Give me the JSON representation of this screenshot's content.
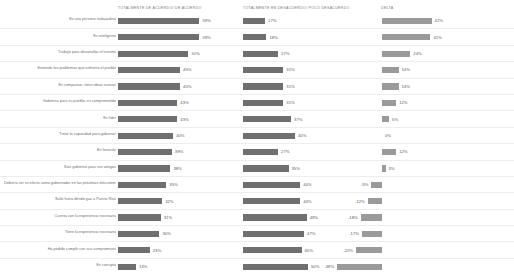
{
  "title": "",
  "headers": {
    "col1": "TOTALMENTE DE ACUERDO/ DE ACUERDO",
    "col2": "TOTALMENTE EN DESACUERDO/ POCO DESACUERDO",
    "col3": "DELTA"
  },
  "chart_data": {
    "type": "bar",
    "title": "",
    "xlabel": "",
    "ylabel": "",
    "grid": false,
    "legend": "none",
    "orientation": "horizontal",
    "categories": [
      "Es una persona trabajadora",
      "Es inteligente",
      "Trabajó para desarrollar el turismo",
      "Entiende los problemas que enfrenta el pueblo",
      "Es compasivo, tiene ideas nuevas",
      "Gobierna para su pueblo, es comprometido",
      "Es líder",
      "Tiene la capacidad para gobernar",
      "Es honesto",
      "Sois gobierno para sus amigos",
      "Debería ser re-electo como gobernador en las próximas elecciones",
      "Salió fuera déndo gaz a Puerto Rico",
      "Cuenta con la experiencia necesaria",
      "Tiene la experiencia necesaria",
      "Ha podido cumplir con sus compromisos",
      "Es corrupto"
    ],
    "series": [
      {
        "name": "TOTALMENTE DE ACUERDO/ DE ACUERDO",
        "values": [
          59,
          59,
          51,
          45,
          45,
          43,
          43,
          40,
          39,
          38,
          35,
          32,
          31,
          30,
          23,
          13
        ],
        "labels": [
          "59%",
          "59%",
          "51%",
          "45%",
          "45%",
          "43%",
          "43%",
          "40%",
          "39%",
          "38%",
          "35%",
          "32%",
          "31%",
          "30%",
          "23%",
          "13%"
        ]
      },
      {
        "name": "TOTALMENTE EN DESACUERDO/ POCO DESACUERDO",
        "values": [
          17,
          18,
          27,
          31,
          31,
          31,
          37,
          40,
          27,
          35,
          44,
          44,
          49,
          47,
          45,
          50
        ],
        "labels": [
          "17%",
          "18%",
          "27%",
          "31%",
          "31%",
          "31%",
          "37%",
          "40%",
          "27%",
          "35%",
          "44%",
          "44%",
          "49%",
          "47%",
          "45%",
          "50%"
        ]
      },
      {
        "name": "DELTA",
        "values": [
          42,
          41,
          24,
          14,
          14,
          12,
          6,
          0,
          12,
          3,
          -9,
          -12,
          -18,
          -17,
          -22,
          -38
        ],
        "labels": [
          "42%",
          "41%",
          "24%",
          "14%",
          "14%",
          "12%",
          "6%",
          "0%",
          "12%",
          "3%",
          "-9%",
          "-12%",
          "-18%",
          "-17%",
          "-22%",
          "-38%"
        ]
      }
    ]
  }
}
